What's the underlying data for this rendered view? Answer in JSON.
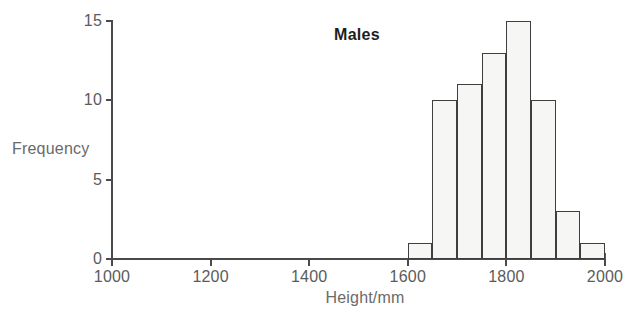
{
  "chart_data": {
    "type": "bar",
    "title": "Males",
    "xlabel": "Height/mm",
    "ylabel": "Frequency",
    "grid": false,
    "legend": null,
    "xlim": [
      1000,
      2000
    ],
    "ylim": [
      0,
      15
    ],
    "bin_width": 50,
    "x_ticks": [
      1000,
      1200,
      1400,
      1600,
      1800,
      2000
    ],
    "x_tick_labels": [
      "1000",
      "1200",
      "1400",
      "1600",
      "1800",
      "2000"
    ],
    "y_ticks": [
      0,
      5,
      10,
      15
    ],
    "y_tick_labels": [
      "0",
      "5",
      "10",
      "15"
    ],
    "bins": [
      {
        "start": 1600,
        "end": 1650,
        "value": 1
      },
      {
        "start": 1650,
        "end": 1700,
        "value": 10
      },
      {
        "start": 1700,
        "end": 1750,
        "value": 11
      },
      {
        "start": 1750,
        "end": 1800,
        "value": 13
      },
      {
        "start": 1800,
        "end": 1850,
        "value": 15
      },
      {
        "start": 1850,
        "end": 1900,
        "value": 10
      },
      {
        "start": 1900,
        "end": 1950,
        "value": 3
      },
      {
        "start": 1950,
        "end": 2000,
        "value": 1
      }
    ],
    "categories": [
      "1600-1650",
      "1650-1700",
      "1700-1750",
      "1750-1800",
      "1800-1850",
      "1850-1900",
      "1900-1950",
      "1950-2000"
    ],
    "values": [
      1,
      10,
      11,
      13,
      15,
      10,
      3,
      1
    ],
    "colors": {
      "bar_fill": "#f6f6f4",
      "bar_stroke": "#3f3f3f",
      "axis": "#4a4a4a",
      "tick_label": "#5b5b5b",
      "axis_label": "#6a6a6a",
      "title": "#1e1e1e",
      "background": "#ffffff"
    }
  }
}
